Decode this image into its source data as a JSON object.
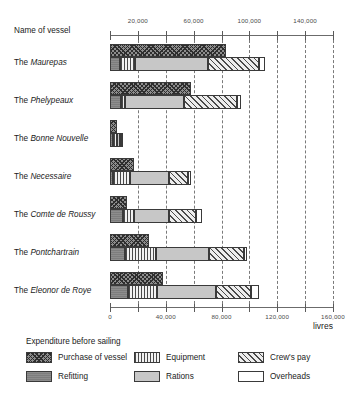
{
  "header": {
    "name_column_label": "Name of vessel",
    "units_label": "livres",
    "legend_title": "Expenditure before sailing"
  },
  "axis": {
    "top_ticklabels": [
      "20,000",
      "60,000",
      "100,000",
      "140,000"
    ],
    "top_tickvalues": [
      20000,
      60000,
      100000,
      140000
    ],
    "bottom_ticklabels": [
      "0",
      "40,000",
      "80,000",
      "120,000",
      "160,000"
    ],
    "bottom_tickvalues": [
      0,
      40000,
      80000,
      120000,
      160000
    ],
    "all_tickvalues": [
      0,
      20000,
      40000,
      60000,
      80000,
      100000,
      120000,
      140000,
      160000
    ],
    "min": 0,
    "max": 160000
  },
  "legend": [
    {
      "key": "purchase",
      "label": "Purchase of vessel",
      "pattern": "cross-hatch-dark"
    },
    {
      "key": "refitting",
      "label": "Refitting",
      "pattern": "solid-dark-gray"
    },
    {
      "key": "equipment",
      "label": "Equipment",
      "pattern": "vertical-stripes"
    },
    {
      "key": "rations",
      "label": "Rations",
      "pattern": "solid-light-gray"
    },
    {
      "key": "crew",
      "label": "Crew's pay",
      "pattern": "diagonal-hatch"
    },
    {
      "key": "overheads",
      "label": "Overheads",
      "pattern": "white"
    }
  ],
  "chart_data": {
    "type": "bar",
    "title": "Expenditure before sailing",
    "subtype": "paired-horizontal-bars-with-stacked-costs",
    "xlabel": "livres",
    "ylabel": "Name of vessel",
    "xlim": [
      0,
      160000
    ],
    "grid": true,
    "grid_orientation": "vertical-dashed",
    "legend_position": "below-plot",
    "categories": [
      "The Maurepas",
      "The Phelypeaux",
      "The Bonne Nouvelle",
      "The Necessaire",
      "The Comte de Roussy",
      "The Pontchartrain",
      "The Eleonor de Roye"
    ],
    "series": [
      {
        "name": "Purchase of vessel",
        "values": [
          83000,
          58000,
          5000,
          17000,
          12000,
          28000,
          38000
        ]
      },
      {
        "name": "Refitting",
        "values": [
          7000,
          8000,
          2000,
          2000,
          9000,
          11000,
          13000
        ]
      },
      {
        "name": "Equipment",
        "values": [
          11000,
          3000,
          3000,
          12000,
          8000,
          22000,
          21000
        ]
      },
      {
        "name": "Rations",
        "values": [
          52000,
          42000,
          2000,
          28000,
          25000,
          38000,
          42000
        ]
      },
      {
        "name": "Crew's pay",
        "values": [
          37000,
          38000,
          1000,
          14000,
          20000,
          25000,
          25000
        ]
      },
      {
        "name": "Overheads",
        "values": [
          4000,
          3000,
          1000,
          2000,
          4000,
          2000,
          6000
        ]
      }
    ],
    "rows": [
      {
        "vessel_article": "The",
        "vessel_name": "Maurepas",
        "purchase": 83000,
        "stack": {
          "refitting": 7000,
          "equipment": 11000,
          "rations": 52000,
          "crew": 37000,
          "overheads": 4000
        },
        "stack_total": 111000
      },
      {
        "vessel_article": "The",
        "vessel_name": "Phelypeaux",
        "purchase": 58000,
        "stack": {
          "refitting": 8000,
          "equipment": 3000,
          "rations": 42000,
          "crew": 38000,
          "overheads": 3000
        },
        "stack_total": 94000
      },
      {
        "vessel_article": "The",
        "vessel_name": "Bonne Nouvelle",
        "purchase": 5000,
        "stack": {
          "refitting": 2000,
          "equipment": 3000,
          "rations": 2000,
          "crew": 1000,
          "overheads": 1000
        },
        "stack_total": 9000
      },
      {
        "vessel_article": "The",
        "vessel_name": "Necessaire",
        "purchase": 17000,
        "stack": {
          "refitting": 2000,
          "equipment": 12000,
          "rations": 28000,
          "crew": 14000,
          "overheads": 2000
        },
        "stack_total": 58000
      },
      {
        "vessel_article": "The",
        "vessel_name": "Comte de Roussy",
        "purchase": 12000,
        "stack": {
          "refitting": 9000,
          "equipment": 8000,
          "rations": 25000,
          "crew": 20000,
          "overheads": 4000
        },
        "stack_total": 66000
      },
      {
        "vessel_article": "The",
        "vessel_name": "Pontchartrain",
        "purchase": 28000,
        "stack": {
          "refitting": 11000,
          "equipment": 22000,
          "rations": 38000,
          "crew": 25000,
          "overheads": 2000
        },
        "stack_total": 98000
      },
      {
        "vessel_article": "The",
        "vessel_name": "Eleonor de Roye",
        "purchase": 38000,
        "stack": {
          "refitting": 13000,
          "equipment": 21000,
          "rations": 42000,
          "crew": 25000,
          "overheads": 6000
        },
        "stack_total": 107000
      }
    ]
  }
}
